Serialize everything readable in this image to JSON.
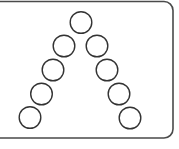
{
  "diagram": {
    "frame": {
      "x": -10,
      "y": 1.5,
      "width": 183,
      "height": 136.5,
      "radius": 9,
      "stroke": "#4a4a4a",
      "stroke_width": 1.6
    },
    "circle_style": {
      "radius": 10.8,
      "stroke": "#333333",
      "stroke_width": 1.4,
      "fill": "#ffffff"
    },
    "circles": [
      {
        "id": "apex",
        "cx": 81,
        "cy": 22.5
      },
      {
        "id": "left-1",
        "cx": 64,
        "cy": 46
      },
      {
        "id": "left-2",
        "cx": 53,
        "cy": 70
      },
      {
        "id": "left-3",
        "cx": 41.5,
        "cy": 94
      },
      {
        "id": "left-4",
        "cx": 30,
        "cy": 117.5
      },
      {
        "id": "right-1",
        "cx": 97,
        "cy": 46
      },
      {
        "id": "right-2",
        "cx": 107,
        "cy": 70
      },
      {
        "id": "right-3",
        "cx": 119,
        "cy": 94
      },
      {
        "id": "right-4",
        "cx": 130,
        "cy": 118
      }
    ]
  }
}
